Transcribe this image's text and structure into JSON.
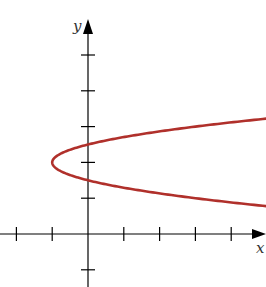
{
  "chart_data": {
    "type": "line",
    "title": "",
    "xlabel": "x",
    "ylabel": "y",
    "equation": "x = 4(y - 2)^2 - 1",
    "curve_color": "#b0302b",
    "axis_color": "#000000",
    "xlim": [
      -2.4,
      4.9
    ],
    "ylim": [
      -1.5,
      6.2
    ],
    "x_ticks": [
      -2,
      -1,
      1,
      2,
      3,
      4
    ],
    "y_ticks": [
      -1,
      1,
      2,
      3,
      4,
      5
    ],
    "tick_labels_shown": false,
    "grid": false,
    "vertex": {
      "x": -1,
      "y": 2
    },
    "y_intercepts": [
      1.5,
      2.5
    ],
    "series": [
      {
        "name": "parabola",
        "points": [
          {
            "x": 4.94,
            "y": 3.22
          },
          {
            "x": 3,
            "y": 3.0
          },
          {
            "x": 1.25,
            "y": 2.75
          },
          {
            "x": 0,
            "y": 2.5
          },
          {
            "x": -0.75,
            "y": 2.25
          },
          {
            "x": -1,
            "y": 2.0
          },
          {
            "x": -0.75,
            "y": 1.75
          },
          {
            "x": 0,
            "y": 1.5
          },
          {
            "x": 1.25,
            "y": 1.25
          },
          {
            "x": 3,
            "y": 1.0
          },
          {
            "x": 4.94,
            "y": 0.78
          }
        ]
      }
    ]
  }
}
